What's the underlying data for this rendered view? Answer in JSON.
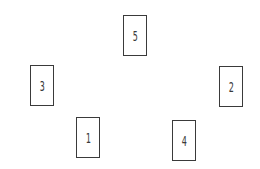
{
  "diagram": {
    "type": "card-spread",
    "cards": [
      {
        "label": "5",
        "x": 123,
        "y": 15
      },
      {
        "label": "3",
        "x": 30,
        "y": 65
      },
      {
        "label": "2",
        "x": 219,
        "y": 66
      },
      {
        "label": "1",
        "x": 76,
        "y": 117
      },
      {
        "label": "4",
        "x": 172,
        "y": 120
      }
    ],
    "colors": {
      "border": "#3a3a3a",
      "background": "#ffffff"
    }
  }
}
